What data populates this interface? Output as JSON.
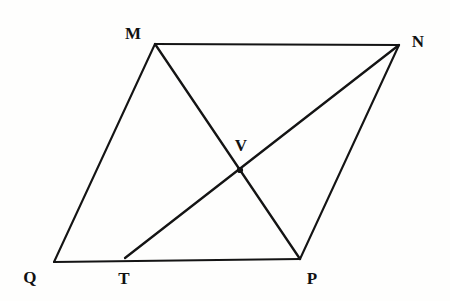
{
  "figure": {
    "background_color": "#fefefd",
    "stroke_color": "#141414",
    "label_color": "#111111",
    "canvas": {
      "width": 450,
      "height": 301
    },
    "points": {
      "M": {
        "label": "M",
        "x": 155,
        "y": 44,
        "label_x": 133,
        "label_y": 33
      },
      "N": {
        "label": "N",
        "x": 399,
        "y": 45,
        "label_x": 418,
        "label_y": 41
      },
      "P": {
        "label": "P",
        "x": 300,
        "y": 259,
        "label_x": 312,
        "label_y": 278
      },
      "Q": {
        "label": "Q",
        "x": 54,
        "y": 262,
        "label_x": 30,
        "label_y": 277
      },
      "T": {
        "label": "T",
        "x": 125,
        "y": 258,
        "label_x": 124,
        "label_y": 278
      },
      "V": {
        "label": "V",
        "x": 240,
        "y": 170,
        "label_x": 241,
        "label_y": 145
      }
    },
    "segments": [
      {
        "name": "MN",
        "from": "M",
        "to": "N",
        "kind": "edge"
      },
      {
        "name": "NP",
        "from": "N",
        "to": "P",
        "kind": "edge"
      },
      {
        "name": "PQ",
        "from": "P",
        "to": "Q",
        "kind": "edge"
      },
      {
        "name": "QM",
        "from": "Q",
        "to": "M",
        "kind": "edge"
      },
      {
        "name": "MP",
        "from": "M",
        "to": "P",
        "kind": "diagonal"
      },
      {
        "name": "TN",
        "from": "T",
        "to": "N",
        "kind": "diagonal"
      }
    ],
    "intersection": {
      "name": "V",
      "of": [
        "MP",
        "TN"
      ],
      "x": 240,
      "y": 170
    }
  }
}
